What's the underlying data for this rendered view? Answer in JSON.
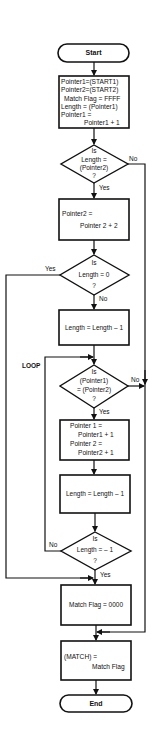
{
  "flowchart": {
    "start": "Start",
    "end": "End",
    "init_box": {
      "lines": [
        "Pointer1=(START1)",
        "Pointer2=(START2)",
        "Match Flag = FFFF",
        "Length = (Pointer1)",
        "Pointer1 =",
        "Pointer1 + 1"
      ]
    },
    "decision1": {
      "lines": [
        "Is",
        "Length =",
        "(Pointer2)",
        "?"
      ],
      "yes": "Yes",
      "no": "No"
    },
    "box2": {
      "lines": [
        "Pointer2 =",
        "Pointer 2 + 2"
      ]
    },
    "decision2": {
      "lines": [
        "Is",
        "Length = 0",
        "?"
      ],
      "yes": "Yes",
      "no": "No"
    },
    "box3": {
      "text": "Length = Length – 1"
    },
    "loop_label": "LOOP",
    "decision3": {
      "lines": [
        "Is",
        "(Pointer1)",
        "= (Pointer2)",
        "?"
      ],
      "yes": "Yes",
      "no": "No"
    },
    "box4": {
      "lines": [
        "Pointer 1 =",
        "Pointer1 + 1",
        "Pointer 2 =",
        "Pointer2 + 1"
      ]
    },
    "box5": {
      "text": "Length = Length – 1"
    },
    "decision4": {
      "lines": [
        "Is",
        "Length = – 1",
        "?"
      ],
      "yes": "Yes",
      "no": "No"
    },
    "box6": {
      "text": "Match Flag = 0000"
    },
    "box7": {
      "lines": [
        "(MATCH) =",
        "Match Flag"
      ]
    }
  },
  "colors": {
    "line": "#111111",
    "background": "#ffffff"
  }
}
